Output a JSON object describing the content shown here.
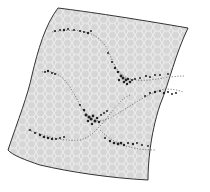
{
  "diagram": {
    "type": "self-organizing-map-manifold",
    "colors": {
      "background": "#ffffff",
      "sheet_fill": "#d6d6d6",
      "hex_stroke": "#f2f2f2",
      "outline": "#333333",
      "curve": "#555555",
      "points": "#222222"
    },
    "curves": [
      {
        "name": "upper-curve",
        "label": ""
      },
      {
        "name": "middle-curve",
        "label": ""
      },
      {
        "name": "lower-curve",
        "label": ""
      }
    ]
  }
}
